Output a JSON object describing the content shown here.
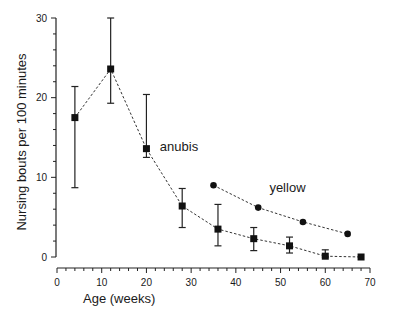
{
  "chart_data": {
    "type": "line",
    "title": "",
    "xlabel": "Age (weeks)",
    "ylabel": "Nursing bouts per 100 minutes",
    "xlim": [
      0,
      70
    ],
    "ylim": [
      0,
      30
    ],
    "x_ticks": [
      0,
      10,
      20,
      30,
      40,
      50,
      60,
      70
    ],
    "y_ticks": [
      0,
      10,
      20,
      30
    ],
    "x_minor_step": 2,
    "y_minor_step": 2,
    "grid": false,
    "legend": "inline labels",
    "series": [
      {
        "name": "anubis",
        "marker": "square",
        "line": "dotted",
        "x": [
          4,
          12,
          20,
          28,
          36,
          44,
          52,
          60,
          68
        ],
        "values": [
          17.5,
          23.6,
          13.6,
          6.4,
          3.5,
          2.3,
          1.4,
          0.1,
          0.0
        ],
        "error_upper": [
          21.4,
          30.0,
          20.4,
          8.6,
          6.6,
          3.7,
          2.5,
          0.9,
          null
        ],
        "error_lower": [
          8.7,
          19.3,
          12.5,
          3.7,
          1.4,
          0.8,
          0.5,
          0.0,
          null
        ],
        "label_position": {
          "x": 23,
          "y": 13.3
        }
      },
      {
        "name": "yellow",
        "marker": "circle",
        "line": "dotted",
        "x": [
          35,
          45,
          55,
          65
        ],
        "values": [
          9.0,
          6.2,
          4.4,
          2.9
        ],
        "label_position": {
          "x": 47.5,
          "y": 8.1
        }
      }
    ]
  }
}
